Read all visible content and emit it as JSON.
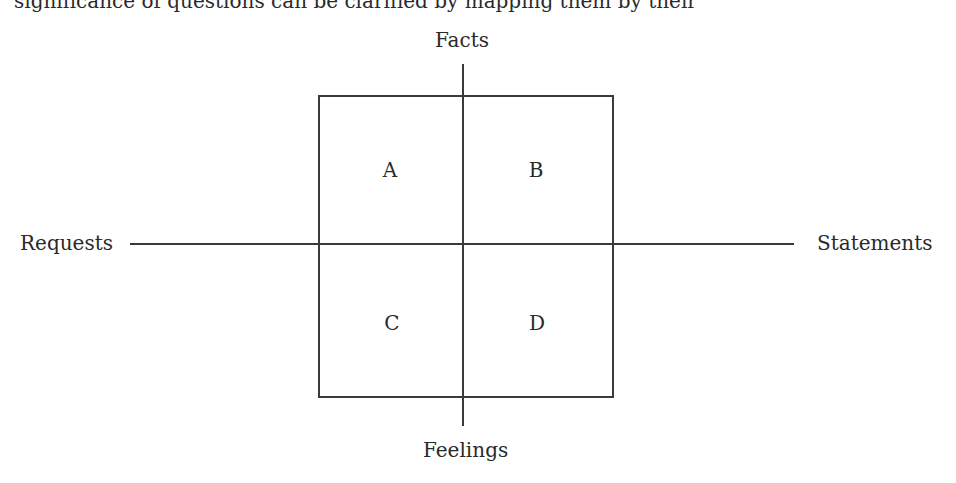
{
  "caption": {
    "clipped_text": "significance of questions can be clarified by mapping them by their"
  },
  "diagram": {
    "axes": {
      "top": "Facts",
      "bottom": "Feelings",
      "left": "Requests",
      "right": "Statements"
    },
    "quadrants": [
      {
        "id": "A",
        "label": "A",
        "position": "top-left"
      },
      {
        "id": "B",
        "label": "B",
        "position": "top-right"
      },
      {
        "id": "C",
        "label": "C",
        "position": "bottom-left"
      },
      {
        "id": "D",
        "label": "D",
        "position": "bottom-right"
      }
    ],
    "colors": {
      "line": "#3a3a3a",
      "text": "#2a2a2a",
      "background": "#ffffff"
    }
  }
}
